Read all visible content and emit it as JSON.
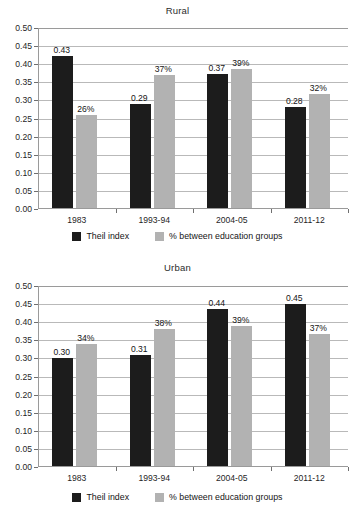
{
  "figure": {
    "panels": [
      "Rural",
      "Urban"
    ]
  },
  "legend": {
    "items": [
      {
        "label": "Theil index",
        "color": "#1c1c1c",
        "swatch_name": "legend-swatch-theil"
      },
      {
        "label": "% between education groups",
        "color": "#b2b2b2",
        "swatch_name": "legend-swatch-education"
      }
    ]
  },
  "axis": {
    "yticks": [
      "0.00",
      "0.05",
      "0.10",
      "0.15",
      "0.20",
      "0.25",
      "0.30",
      "0.35",
      "0.40",
      "0.45",
      "0.50"
    ],
    "ymin": 0.0,
    "ymax": 0.5
  },
  "chart_data": [
    {
      "type": "bar",
      "title": "Rural",
      "xlabel": "",
      "ylabel": "",
      "ylim": [
        0,
        0.5
      ],
      "grid": true,
      "legend_position": "bottom",
      "categories": [
        "1983",
        "1993-94",
        "2004-05",
        "2011-12"
      ],
      "series": [
        {
          "name": "Theil index",
          "color": "#1c1c1c",
          "values": [
            0.42,
            0.287,
            0.37,
            0.279
          ],
          "labels": [
            "0.43",
            "0.29",
            "0.37",
            "0.28"
          ]
        },
        {
          "name": "% between education groups",
          "color": "#b2b2b2",
          "values": [
            0.258,
            0.368,
            0.385,
            0.316
          ],
          "labels": [
            "26%",
            "37%",
            "39%",
            "32%"
          ]
        }
      ]
    },
    {
      "type": "bar",
      "title": "Urban",
      "xlabel": "",
      "ylabel": "",
      "ylim": [
        0,
        0.5
      ],
      "grid": true,
      "legend_position": "bottom",
      "categories": [
        "1983",
        "1993-94",
        "2004-05",
        "2011-12"
      ],
      "series": [
        {
          "name": "Theil index",
          "color": "#1c1c1c",
          "values": [
            0.299,
            0.307,
            0.433,
            0.447
          ],
          "labels": [
            "0.30",
            "0.31",
            "0.44",
            "0.45"
          ]
        },
        {
          "name": "% between education groups",
          "color": "#b2b2b2",
          "values": [
            0.337,
            0.378,
            0.386,
            0.365
          ],
          "labels": [
            "34%",
            "38%",
            "39%",
            "37%"
          ]
        }
      ]
    }
  ]
}
